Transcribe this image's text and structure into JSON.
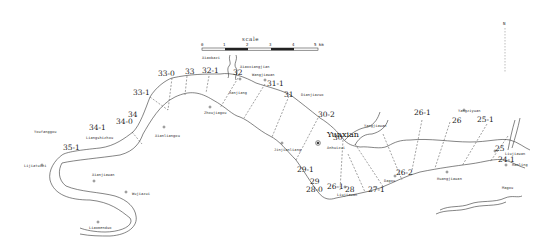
{
  "scale": {
    "title": "scale",
    "ticks": [
      "0",
      "1",
      "2",
      "3",
      "4",
      "5 km"
    ]
  },
  "north_marker": {
    "label": "N"
  },
  "sections": [
    {
      "id": "s33_0",
      "label": "33-0"
    },
    {
      "id": "s33",
      "label": "33"
    },
    {
      "id": "s32_1",
      "label": "32-1"
    },
    {
      "id": "s32",
      "label": "32"
    },
    {
      "id": "s31_1",
      "label": "31-1"
    },
    {
      "id": "s31",
      "label": "31"
    },
    {
      "id": "s30_2",
      "label": "30-2"
    },
    {
      "id": "s33_1",
      "label": "33-1"
    },
    {
      "id": "s34",
      "label": "34"
    },
    {
      "id": "s34_0",
      "label": "34-0"
    },
    {
      "id": "s34_1",
      "label": "34-1"
    },
    {
      "id": "s35_1",
      "label": "35-1"
    },
    {
      "id": "s30",
      "label": "30"
    },
    {
      "id": "s29_1",
      "label": "29-1"
    },
    {
      "id": "s29",
      "label": "29"
    },
    {
      "id": "s28_0",
      "label": "28-0"
    },
    {
      "id": "s26_1b",
      "label": "26-1"
    },
    {
      "id": "s28",
      "label": "28"
    },
    {
      "id": "s27_1",
      "label": "27-1"
    },
    {
      "id": "s26_2",
      "label": "26-2"
    },
    {
      "id": "s26_1",
      "label": "26-1"
    },
    {
      "id": "s26",
      "label": "26"
    },
    {
      "id": "s25_1",
      "label": "25-1"
    },
    {
      "id": "s25",
      "label": "25"
    },
    {
      "id": "s24_1",
      "label": "24-1"
    }
  ],
  "places": [
    {
      "id": "xiaobazi",
      "label": "Xiaobazi"
    },
    {
      "id": "xiaoxiangtan",
      "label": "Xiaoxiangjian"
    },
    {
      "id": "wangjiawan",
      "label": "Wangjiawan"
    },
    {
      "id": "hanjiang",
      "label": "Hanjiang"
    },
    {
      "id": "zhoujiagou",
      "label": "Zhoujiagou"
    },
    {
      "id": "dianjianzuo",
      "label": "Dianjiazuo"
    },
    {
      "id": "jinjianliang",
      "label": "Jinjianliang"
    },
    {
      "id": "yunxian",
      "label": "Yunxian"
    },
    {
      "id": "xiangjiawan",
      "label": "Yangjiawan"
    },
    {
      "id": "anhuizui",
      "label": "Anhuizui"
    },
    {
      "id": "liujiawan",
      "label": "Liujiawan"
    },
    {
      "id": "dagou",
      "label": "Dagou"
    },
    {
      "id": "huangjiawan",
      "label": "Huangjiawan"
    },
    {
      "id": "yangziyuan",
      "label": "Yangziyuan"
    },
    {
      "id": "liujiawan2",
      "label": "Liujiawan"
    },
    {
      "id": "hanling",
      "label": "Hanling"
    },
    {
      "id": "magou",
      "label": "Magou"
    },
    {
      "id": "youfanggou",
      "label": "Youfanggou"
    },
    {
      "id": "liangshizhou",
      "label": "Liangshizhou"
    },
    {
      "id": "xianliangou",
      "label": "Xianliangou"
    },
    {
      "id": "lijiatuizi",
      "label": "Lijiatuizi"
    },
    {
      "id": "xianjiawan",
      "label": "Xianjiawan"
    },
    {
      "id": "wujiazui",
      "label": "Wujiazui"
    },
    {
      "id": "liaomenduo",
      "label": "Liaomenduo"
    }
  ]
}
